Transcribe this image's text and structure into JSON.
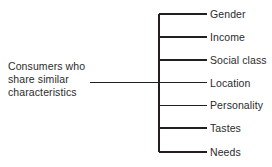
{
  "diagram": {
    "type": "bracket-diagram",
    "orientation": "left-to-right",
    "root": {
      "lines": [
        "Consumers who",
        "share similar",
        "characteristics"
      ]
    },
    "branches": [
      {
        "label": "Gender"
      },
      {
        "label": "Income"
      },
      {
        "label": "Social class"
      },
      {
        "label": "Location"
      },
      {
        "label": "Personality"
      },
      {
        "label": "Tastes"
      },
      {
        "label": "Needs"
      }
    ],
    "colors": {
      "background": "#ffffff",
      "line": "#231f20",
      "text": "#2b2b2b"
    }
  }
}
